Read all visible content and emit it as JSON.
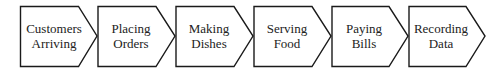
{
  "diagram": {
    "type": "process-flow",
    "stroke_color": "#1a1a1a",
    "steps": [
      {
        "line1": "Customers",
        "line2": "Arriving"
      },
      {
        "line1": "Placing",
        "line2": "Orders"
      },
      {
        "line1": "Making",
        "line2": "Dishes"
      },
      {
        "line1": "Serving",
        "line2": "Food"
      },
      {
        "line1": "Paying",
        "line2": "Bills"
      },
      {
        "line1": "Recording",
        "line2": "Data"
      }
    ]
  }
}
